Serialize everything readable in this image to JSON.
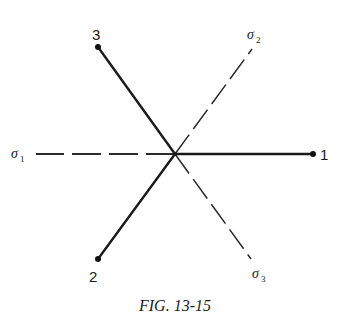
{
  "figure": {
    "caption": "FIG. 13-15",
    "center": {
      "x": 175,
      "y": 154
    },
    "solid_axes": [
      {
        "id": "1",
        "label": "1",
        "end": {
          "x": 313,
          "y": 154
        }
      },
      {
        "id": "2",
        "label": "2",
        "end": {
          "x": 98,
          "y": 259
        }
      },
      {
        "id": "3",
        "label": "3",
        "end": {
          "x": 98,
          "y": 47
        }
      }
    ],
    "dashed_axes": [
      {
        "id": "sigma1",
        "symbol": "σ",
        "subscript": "1",
        "end": {
          "x": 36,
          "y": 154
        }
      },
      {
        "id": "sigma2",
        "symbol": "σ",
        "subscript": "2",
        "end": {
          "x": 252,
          "y": 49
        }
      },
      {
        "id": "sigma3",
        "symbol": "σ",
        "subscript": "3",
        "end": {
          "x": 251,
          "y": 259
        }
      }
    ]
  },
  "labels": {
    "axis_1": "1",
    "axis_2": "2",
    "axis_3": "3",
    "sigma_symbol": "σ",
    "sigma_1_sub": "1",
    "sigma_2_sub": "2",
    "sigma_3_sub": "3"
  },
  "colors": {
    "line": "#1a1a1a",
    "background": "#ffffff"
  }
}
